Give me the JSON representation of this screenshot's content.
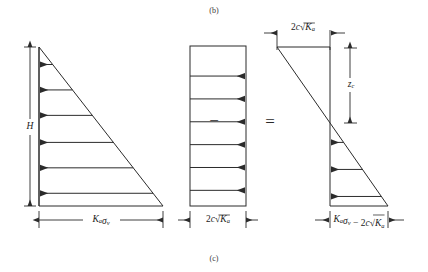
{
  "figure": {
    "top_caption": "(b)",
    "bottom_caption": "(c)",
    "operators": {
      "minus": "−",
      "equals": "="
    }
  },
  "panels": [
    {
      "id": "active-pressure-triangle",
      "name": "lateral-earth-pressure-triangle",
      "shape": "triangle",
      "height_label": "H",
      "base_label": "Kₐσᵥ",
      "base_label_parts": [
        {
          "text": "K",
          "style": "italic"
        },
        {
          "text": "a",
          "style": "sub"
        },
        {
          "text": "σ",
          "style": "italic"
        },
        {
          "text": "v",
          "style": "sub"
        }
      ],
      "arrow_count": 6,
      "arrow_direction": "left",
      "distribution": "linearly-increasing-with-depth"
    },
    {
      "id": "cohesion-pressure-rectangle",
      "name": "cohesion-pressure-rectangle",
      "shape": "rectangle",
      "base_label": "2c√Kₐ",
      "base_label_parts": [
        {
          "text": "2",
          "style": "plain"
        },
        {
          "text": "c",
          "style": "italic"
        },
        {
          "text": "√",
          "style": "radical"
        },
        {
          "text": "K",
          "style": "italic"
        },
        {
          "text": "a",
          "style": "sub"
        }
      ],
      "arrow_count": 6,
      "arrow_direction": "right",
      "distribution": "uniform-with-depth"
    },
    {
      "id": "net-pressure-diagram",
      "name": "net-active-pressure-diagram",
      "shape": "net-diagram",
      "top_label": "2c√Kₐ",
      "top_label_parts": [
        {
          "text": "2",
          "style": "plain"
        },
        {
          "text": "c",
          "style": "italic"
        },
        {
          "text": "√",
          "style": "radical"
        },
        {
          "text": "K",
          "style": "italic"
        },
        {
          "text": "a",
          "style": "sub"
        }
      ],
      "depth_label": "zᴄ",
      "depth_label_parts": [
        {
          "text": "z",
          "style": "italic"
        },
        {
          "text": "c",
          "style": "sub"
        }
      ],
      "base_label": "Kₐσᵥ − 2c√Kₐ",
      "base_label_parts": [
        {
          "text": "K",
          "style": "italic"
        },
        {
          "text": "a",
          "style": "sub"
        },
        {
          "text": "σ",
          "style": "italic"
        },
        {
          "text": "v",
          "style": "sub"
        },
        {
          "text": " − ",
          "style": "plain"
        },
        {
          "text": "2",
          "style": "plain"
        },
        {
          "text": "c",
          "style": "italic"
        },
        {
          "text": "√",
          "style": "radical"
        },
        {
          "text": "K",
          "style": "italic"
        },
        {
          "text": "a",
          "style": "sub"
        }
      ],
      "arrow_count": 3,
      "arrow_direction": "left",
      "distribution": "tension-zone-above-crossover"
    }
  ],
  "chart_data": {
    "type": "line",
    "xlabel": "Lateral pressure",
    "ylabel": "Depth",
    "grid": false,
    "legend": "none",
    "panels": [
      {
        "name": "Kₐσᵥ",
        "series_name": "active-earth-pressure",
        "x": [
          0,
          1
        ],
        "y_depth_fraction": [
          0,
          1
        ],
        "values_at_depth": [
          {
            "depth_fraction": 0.0,
            "pressure": 0.0
          },
          {
            "depth_fraction": 0.2,
            "pressure": 0.2
          },
          {
            "depth_fraction": 0.4,
            "pressure": 0.4
          },
          {
            "depth_fraction": 0.6,
            "pressure": 0.6
          },
          {
            "depth_fraction": 0.8,
            "pressure": 0.8
          },
          {
            "depth_fraction": 1.0,
            "pressure": 1.0
          }
        ],
        "arrow_lengths_normalized": [
          0.11,
          0.27,
          0.43,
          0.6,
          0.76,
          0.92
        ]
      },
      {
        "name": "2c√Kₐ",
        "series_name": "cohesion-pressure",
        "x": [
          1,
          1
        ],
        "y_depth_fraction": [
          0,
          1
        ],
        "values_at_depth": [
          {
            "depth_fraction": 0.0,
            "pressure": 1.0
          },
          {
            "depth_fraction": 0.2,
            "pressure": 1.0
          },
          {
            "depth_fraction": 0.4,
            "pressure": 1.0
          },
          {
            "depth_fraction": 0.6,
            "pressure": 1.0
          },
          {
            "depth_fraction": 0.8,
            "pressure": 1.0
          },
          {
            "depth_fraction": 1.0,
            "pressure": 1.0
          }
        ],
        "arrow_lengths_normalized": [
          1.0,
          1.0,
          1.0,
          1.0,
          1.0,
          1.0
        ]
      },
      {
        "name": "Kₐσᵥ − 2c√Kₐ",
        "series_name": "net-active-pressure",
        "x": [
          -1,
          1
        ],
        "y_depth_fraction": [
          0,
          1
        ],
        "zero_crossing_depth_fraction": 0.48,
        "values_at_depth": [
          {
            "depth_fraction": 0.0,
            "pressure": -1.0
          },
          {
            "depth_fraction": 0.48,
            "pressure": 0.0
          },
          {
            "depth_fraction": 0.65,
            "pressure": 0.35
          },
          {
            "depth_fraction": 0.8,
            "pressure": 0.67
          },
          {
            "depth_fraction": 0.93,
            "pressure": 0.93
          },
          {
            "depth_fraction": 1.0,
            "pressure": 1.07
          }
        ],
        "arrow_lengths_normalized": [
          0.3,
          0.57,
          0.83
        ]
      }
    ]
  }
}
